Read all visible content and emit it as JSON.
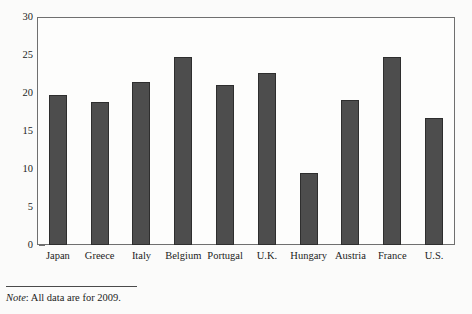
{
  "chart_data": {
    "type": "bar",
    "title": "",
    "subtitle": "",
    "xlabel": "",
    "ylabel": "",
    "ylim": [
      0,
      30
    ],
    "y_ticks": [
      0,
      5,
      10,
      15,
      20,
      25,
      30
    ],
    "grid": false,
    "legend": null,
    "categories": [
      "Japan",
      "Greece",
      "Italy",
      "Belgium",
      "Portugal",
      "U.K.",
      "Hungary",
      "Austria",
      "France",
      "U.S."
    ],
    "values": [
      19.7,
      18.8,
      21.4,
      24.7,
      21.0,
      22.6,
      9.5,
      19.1,
      24.7,
      16.7
    ],
    "series": [
      {
        "name": "",
        "values": [
          19.7,
          18.8,
          21.4,
          24.7,
          21.0,
          22.6,
          9.5,
          19.1,
          24.7,
          16.7
        ]
      }
    ],
    "bar_color": "#4d4d4d",
    "bar_edge_color": "#2e2e2e",
    "annotations": []
  },
  "note": {
    "label": "Note",
    "separator": ": ",
    "text": "All data are for 2009.",
    "full": "Note: All data are for 2009."
  }
}
